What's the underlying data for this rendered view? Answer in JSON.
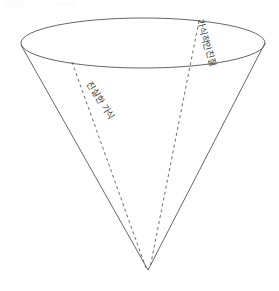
{
  "figure": {
    "type": "cone-diagram",
    "background_color": "#ffffff",
    "stroke_color": "#555555",
    "dash_color": "#5a5a5a",
    "text_color": "#3a3a3a",
    "geometry": {
      "ellipse_center_x": 143,
      "ellipse_center_y": 43,
      "ellipse_rx": 122,
      "ellipse_ry": 25,
      "apex_x": 148,
      "apex_y": 270,
      "left_rim_x": 21,
      "left_rim_y": 45,
      "right_rim_x": 265,
      "right_rim_y": 43,
      "dash_left_start_x": 72,
      "dash_left_start_y": 62,
      "dash_right_start_x": 199,
      "dash_right_start_y": 21
    }
  },
  "labels": {
    "right": {
      "text": "가식적인친절",
      "rotation_deg": 75
    },
    "left": {
      "text": "진실한 가식",
      "rotation_deg": 57
    }
  }
}
